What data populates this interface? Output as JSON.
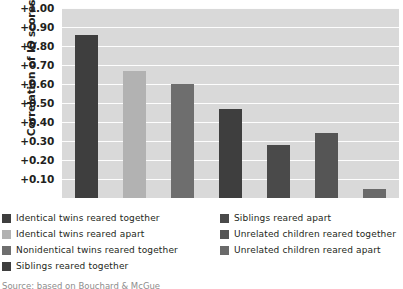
{
  "chart_data": {
    "type": "bar",
    "title": "",
    "xlabel": "",
    "ylabel": "Correlation of IQ scores",
    "ylim": [
      0,
      1.0
    ],
    "grid": true,
    "legend_position": "bottom",
    "tick_labels": [
      "+1.00",
      "+0.90",
      "+0.80",
      "+0.70",
      "+0.60",
      "+0.50",
      "+0.40",
      "+0.30",
      "+0.20",
      "+0.10"
    ],
    "tick_values": [
      1.0,
      0.9,
      0.8,
      0.7,
      0.6,
      0.5,
      0.4,
      0.3,
      0.2,
      0.1
    ],
    "categories": [
      "Identical twins reared together",
      "Identical twins reared apart",
      "Nonidentical twins reared together",
      "Siblings reared together",
      "Siblings reared apart",
      "Unrelated children reared together",
      "Unrelated children reared apart"
    ],
    "values": [
      0.86,
      0.67,
      0.6,
      0.47,
      0.28,
      0.34,
      0.05
    ],
    "colors": [
      "#3e3e3e",
      "#b2b2b2",
      "#6e6e6e",
      "#3e3e3e",
      "#4a4a4a",
      "#555555",
      "#6a6a6a"
    ],
    "plot_background": "#d9d9d9",
    "gridline_color": "#fdfdfd"
  },
  "legend": {
    "left_column": [
      {
        "label": "Identical twins reared together",
        "color": "#3e3e3e"
      },
      {
        "label": "Identical twins reared apart",
        "color": "#b2b2b2"
      },
      {
        "label": "Nonidentical twins reared together",
        "color": "#6e6e6e"
      },
      {
        "label": "Siblings reared together",
        "color": "#3e3e3e"
      }
    ],
    "right_column": [
      {
        "label": "Siblings reared apart",
        "color": "#4a4a4a"
      },
      {
        "label": "Unrelated children reared together",
        "color": "#555555"
      },
      {
        "label": "Unrelated children reared apart",
        "color": "#6a6a6a"
      }
    ]
  },
  "caption_sliver": "Source: based on Bouchard & McGue"
}
